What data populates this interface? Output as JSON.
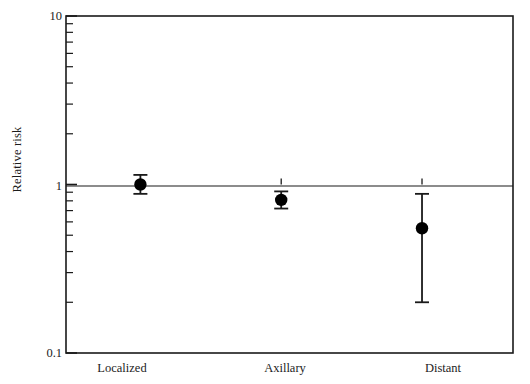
{
  "chart_data": {
    "type": "scatter",
    "title": "",
    "xlabel": "",
    "ylabel": "Relative risk",
    "yscale": "log",
    "ylim": [
      0.1,
      10
    ],
    "grid": false,
    "legend": null,
    "reference_line": 1,
    "categories": [
      "Localized",
      "Axillary",
      "Distant"
    ],
    "values": [
      1.0,
      0.81,
      0.55
    ],
    "error_low": [
      0.88,
      0.72,
      0.2
    ],
    "error_high": [
      1.14,
      0.91,
      0.88
    ],
    "y_tick_labels": [
      "10",
      "1",
      "0.1"
    ],
    "y_tick_values": [
      10,
      1,
      0.1
    ],
    "y_minor_ticks": [
      9,
      8,
      7,
      6,
      5,
      4,
      3,
      2,
      0.9,
      0.8,
      0.7,
      0.6,
      0.5,
      0.4,
      0.3,
      0.2
    ],
    "points": [
      {
        "label": "Localized",
        "rr": 1.0,
        "ci_low": 0.88,
        "ci_high": 1.14
      },
      {
        "label": "Axillary",
        "rr": 0.81,
        "ci_low": 0.72,
        "ci_high": 0.91
      },
      {
        "label": "Distant",
        "rr": 0.55,
        "ci_low": 0.2,
        "ci_high": 0.88
      }
    ],
    "colors": {
      "axis": "#1a1a1a",
      "marker": "#000000",
      "error_bar": "#1a1a1a",
      "reference_line": "#1a1a1a",
      "background": "#ffffff"
    }
  },
  "axis": {
    "y_label": "Relative risk",
    "y_top": "10",
    "y_mid": "1",
    "y_bottom": "0.1"
  },
  "x_labels": {
    "first": "Localized",
    "second": "Axillary",
    "third": "Distant"
  }
}
